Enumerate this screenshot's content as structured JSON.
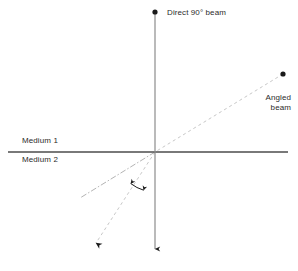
{
  "figure": {
    "title_text": "Refraction of a beam crossing a medium boundary",
    "background_color": "#ffffff",
    "width": 298,
    "height": 271
  },
  "labels": {
    "direct_beam": "Direct 90° beam",
    "angled_beam": "Angled\nbeam",
    "medium_1": "Medium 1",
    "medium_2": "Medium 2"
  },
  "colors": {
    "boundary_line": "#4d4d4d",
    "normal_line": "#8c8c8c",
    "incident_beam": "#c8c8c8",
    "refracted_beam": "#c8c8c8",
    "reflected_ray": "#b4b4b4",
    "marker_dot": "#1a1a1a",
    "arrow": "#1a1a1a",
    "text": "#2b2b2b"
  },
  "geometry": {
    "origin": {
      "x": 155,
      "y": 152
    },
    "boundary": {
      "x1": 8,
      "y1": 152,
      "x2": 288,
      "y2": 152
    },
    "normal": {
      "x1": 155,
      "y1": 12,
      "x2": 155,
      "y2": 255
    },
    "incident_beam": {
      "x1": 283,
      "y1": 74,
      "x2": 155,
      "y2": 152
    },
    "refracted_beam": {
      "x1": 155,
      "y1": 152,
      "x2": 93,
      "y2": 248
    },
    "dash_dot_ray": {
      "x1": 155,
      "y1": 152,
      "x2": 80,
      "y2": 198
    },
    "top_dot": {
      "x": 155,
      "y": 12,
      "r": 2.6
    },
    "right_dot": {
      "x": 283,
      "y": 74,
      "r": 2.6
    },
    "bottom_arrow_tip": {
      "x": 155,
      "y": 255
    },
    "refracted_arrow_tip": {
      "x": 93,
      "y": 248
    },
    "angle_arc": {
      "cx": 155,
      "cy": 152,
      "radius": 40
    }
  },
  "annotations": {
    "angle_arc_name": "refraction-angle-arc",
    "dash_patterns": {
      "beam": "3,3",
      "ray": "6,2,1.5,2"
    }
  }
}
